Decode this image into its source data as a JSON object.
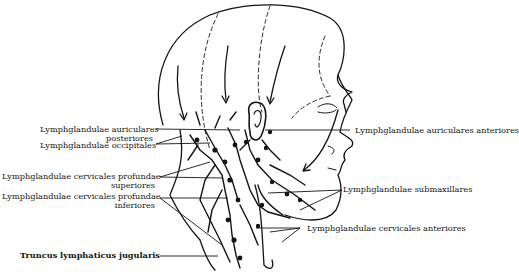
{
  "figure": {
    "labels_left": [
      {
        "id": "auricular-posterior",
        "line1": "Lymphglandulae auriculares",
        "line2": "posteriores"
      },
      {
        "id": "occipital",
        "line1": "Lymphglandulae occipitales",
        "line2": ""
      },
      {
        "id": "deep-cervical-superior",
        "line1": "Lymphglandulae cervicales profundae",
        "line2": "superiores"
      },
      {
        "id": "deep-cervical-inferior",
        "line1": "Lymphglandulae cervicales profundae",
        "line2": "inferiores"
      },
      {
        "id": "jugular-trunk",
        "line1": "Truncus lymphaticus jugularis",
        "line2": ""
      }
    ],
    "labels_right": [
      {
        "id": "auricular-anterior",
        "line1": "Lymphglandulae auriculares anteriores"
      },
      {
        "id": "submaxillary",
        "line1": "Lymphglandulae submaxillares"
      },
      {
        "id": "anterior-cervical",
        "line1": "Lymphglandulae cervicales anteriores"
      }
    ],
    "colors": {
      "ink": "#141414",
      "background": "#ffffff"
    }
  }
}
